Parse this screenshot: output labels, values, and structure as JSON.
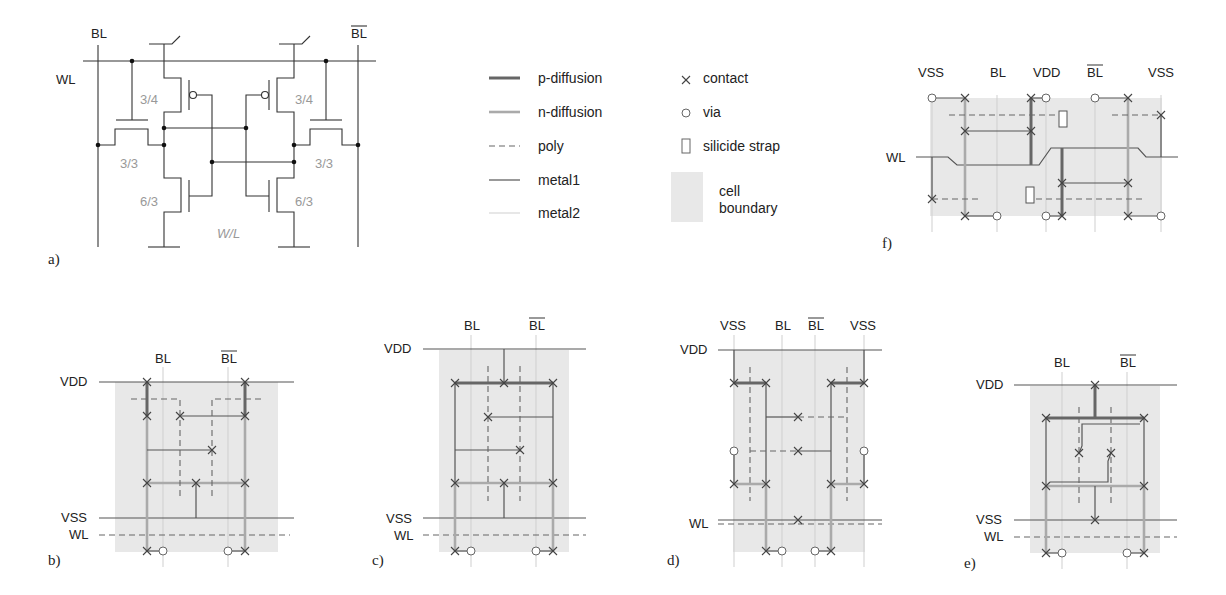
{
  "figure": {
    "panels": [
      {
        "id": "a",
        "label": "a)",
        "type": "6T SRAM schematic"
      },
      {
        "id": "b",
        "label": "b)"
      },
      {
        "id": "c",
        "label": "c)"
      },
      {
        "id": "d",
        "label": "d)"
      },
      {
        "id": "e",
        "label": "e)"
      },
      {
        "id": "f",
        "label": "f)"
      }
    ],
    "schematic": {
      "bl": "BL",
      "blb": "BL",
      "wl": "WL",
      "pmos_ratio_left": "3/4",
      "pmos_ratio_right": "3/4",
      "access_ratio_left": "3/3",
      "access_ratio_right": "3/3",
      "nmos_ratio_left": "6/3",
      "nmos_ratio_right": "6/3",
      "wl_caption": "W/L"
    },
    "legend": {
      "lines": [
        {
          "label": "p-diffusion",
          "style": "p-diffusion"
        },
        {
          "label": "n-diffusion",
          "style": "n-diffusion"
        },
        {
          "label": "poly",
          "style": "poly"
        },
        {
          "label": "metal1",
          "style": "metal1"
        },
        {
          "label": "metal2",
          "style": "metal2"
        }
      ],
      "symbols": [
        {
          "label": "contact",
          "icon": "cross-icon"
        },
        {
          "label": "via",
          "icon": "circle-icon"
        },
        {
          "label": "silicide strap",
          "icon": "rectangle-icon"
        },
        {
          "label": "cell",
          "label2": "boundary",
          "icon": "gray-box-icon"
        }
      ]
    },
    "layout_labels": {
      "vdd": "VDD",
      "vss": "VSS",
      "wl": "WL",
      "bl": "BL",
      "blb": "BL"
    },
    "colors": {
      "p_diffusion": "#666666",
      "n_diffusion": "#aaaaaa",
      "poly": "#666666",
      "metal1": "#555555",
      "metal2": "#cfcfcf",
      "cell_boundary": "#e8e8e8",
      "transistor_ratio_text": "#999999"
    }
  }
}
